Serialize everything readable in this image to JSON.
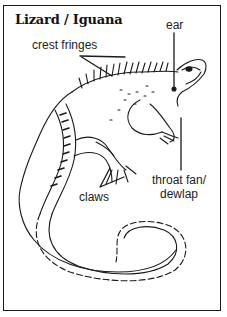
{
  "diagram": {
    "title": "Lizard / Iguana",
    "labels": {
      "crest": "crest fringes",
      "ear": "ear",
      "claws": "claws",
      "throat_line1": "throat fan/",
      "throat_line2": "dewlap"
    },
    "colors": {
      "ink": "#1a1a1a",
      "background": "#ffffff"
    }
  }
}
